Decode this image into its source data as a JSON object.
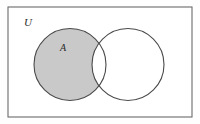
{
  "figure": {
    "kind": "venn-diagram",
    "canvas": {
      "width": 200,
      "height": 124,
      "background": "#fefefe"
    },
    "universe": {
      "label": "U",
      "label_x": 24,
      "label_y": 26,
      "label_font_size": 11,
      "rect": {
        "x": 8,
        "y": 7,
        "width": 184,
        "height": 110
      },
      "stroke": "#6a6a6a",
      "stroke_width": 1.1,
      "fill": "#ffffff"
    },
    "sets": [
      {
        "name": "A",
        "label": "A",
        "label_x": 60,
        "label_y": 51,
        "label_font_size": 10,
        "cx": 70,
        "cy": 64.5,
        "r": 36,
        "fill": "#ffffff",
        "stroke": "#4a4a4a",
        "stroke_width": 1.1,
        "shaded": true
      },
      {
        "name": "B",
        "label": "",
        "cx": 128,
        "cy": 64.5,
        "r": 36,
        "fill": "#ffffff",
        "stroke": "#4a4a4a",
        "stroke_width": 1.1,
        "shaded": false
      }
    ],
    "shading": {
      "region": "A-minus-B",
      "color": "#c9c9c9"
    }
  },
  "chart_data": {
    "type": "diagram",
    "title": "",
    "diagram_type": "venn",
    "universe_label": "U",
    "set_labels": [
      "A",
      ""
    ],
    "set_count": 2,
    "shaded_regions": [
      "A \\ B"
    ],
    "unshaded_regions": [
      "A ∩ B",
      "B \\ A",
      "U \\ (A ∪ B)"
    ],
    "shade_color": "#c9c9c9",
    "outline_color": "#4a4a4a"
  }
}
